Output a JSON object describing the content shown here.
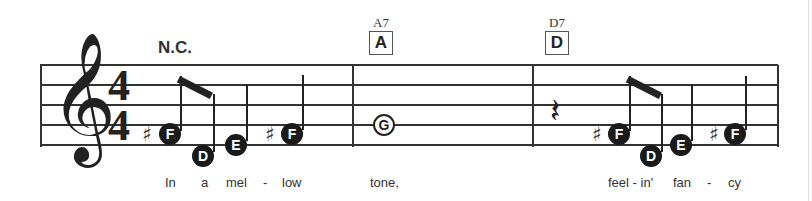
{
  "score": {
    "clef": "treble",
    "clef_glyph": "𝄞",
    "time_signature": {
      "top": "4",
      "bottom": "4"
    },
    "chords": [
      {
        "label": "N.C."
      },
      {
        "name": "A7",
        "box": "A"
      },
      {
        "name": "D7",
        "box": "D"
      }
    ],
    "measures": [
      {
        "notes": [
          {
            "letter": "F",
            "sharp": true,
            "duration": "eighth"
          },
          {
            "letter": "D",
            "sharp": false,
            "duration": "eighth"
          },
          {
            "letter": "E",
            "sharp": false,
            "duration": "quarter"
          },
          {
            "letter": "F",
            "sharp": true,
            "duration": "quarter"
          }
        ]
      },
      {
        "notes": [
          {
            "letter": "G",
            "sharp": false,
            "duration": "whole"
          }
        ]
      },
      {
        "notes": [
          {
            "rest": "quarter"
          },
          {
            "letter": "F",
            "sharp": true,
            "duration": "eighth"
          },
          {
            "letter": "D",
            "sharp": false,
            "duration": "eighth"
          },
          {
            "letter": "E",
            "sharp": false,
            "duration": "quarter"
          },
          {
            "letter": "F",
            "sharp": true,
            "duration": "quarter"
          }
        ]
      }
    ],
    "sharp_glyph": "♯",
    "rest_glyph": "𝄽",
    "lyrics": [
      "In",
      "a",
      "mel",
      "-",
      "low",
      "tone,",
      "feel - in'",
      "fan",
      "-",
      "cy"
    ]
  }
}
